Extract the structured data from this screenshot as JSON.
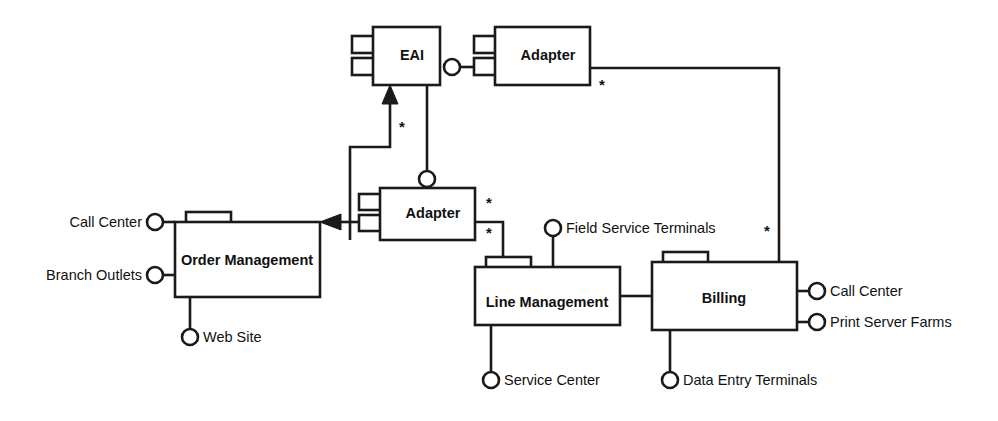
{
  "diagram": {
    "type": "uml-component-diagram",
    "title": "",
    "canvas": {
      "width": 998,
      "height": 421
    },
    "colors": {
      "stroke": "#1a1a1a",
      "fill": "#ffffff",
      "text": "#111111",
      "background": "#ffffff"
    },
    "components": [
      {
        "id": "eai",
        "label": "EAI",
        "x": 373,
        "y": 27,
        "w": 67,
        "h": 58,
        "label_x": 412,
        "label_y": 56,
        "tabs": [
          {
            "x": 352,
            "y": 36,
            "w": 42,
            "h": 17
          },
          {
            "x": 352,
            "y": 58,
            "w": 42,
            "h": 17
          }
        ]
      },
      {
        "id": "adapter-top",
        "label": "Adapter",
        "x": 495,
        "y": 27,
        "w": 95,
        "h": 58,
        "label_x": 548,
        "label_y": 56,
        "tabs": [
          {
            "x": 474,
            "y": 36,
            "w": 42,
            "h": 17
          },
          {
            "x": 474,
            "y": 58,
            "w": 42,
            "h": 17
          }
        ]
      },
      {
        "id": "adapter-lower",
        "label": "Adapter",
        "x": 380,
        "y": 188,
        "w": 95,
        "h": 52,
        "label_x": 433,
        "label_y": 214,
        "tabs": [
          {
            "x": 359,
            "y": 194,
            "w": 42,
            "h": 16
          },
          {
            "x": 359,
            "y": 215,
            "w": 42,
            "h": 16
          }
        ]
      },
      {
        "id": "order-management",
        "label": "Order Management",
        "x": 175,
        "y": 222,
        "w": 145,
        "h": 75,
        "label_x": 247,
        "label_y": 261,
        "tabs": [
          {
            "x": 186,
            "y": 212,
            "w": 45,
            "h": 11
          }
        ]
      },
      {
        "id": "line-management",
        "label": "Line Management",
        "x": 475,
        "y": 267,
        "w": 145,
        "h": 58,
        "label_x": 547,
        "label_y": 303,
        "tabs": [
          {
            "x": 486,
            "y": 257,
            "w": 45,
            "h": 11
          }
        ]
      },
      {
        "id": "billing",
        "label": "Billing",
        "x": 652,
        "y": 262,
        "w": 145,
        "h": 68,
        "label_x": 724,
        "label_y": 299,
        "tabs": [
          {
            "x": 663,
            "y": 252,
            "w": 45,
            "h": 11
          }
        ]
      }
    ],
    "interfaces": [
      {
        "id": "call-center-order",
        "label": "Call Center",
        "owner": "order-management",
        "side": "left",
        "cx": 155,
        "cy": 222,
        "r": 8,
        "stub": {
          "x1": 163,
          "y1": 222,
          "x2": 175,
          "y2": 222
        },
        "label_x": 142,
        "label_y": 223
      },
      {
        "id": "branch-outlets",
        "label": "Branch Outlets",
        "owner": "order-management",
        "side": "left",
        "cx": 155,
        "cy": 275,
        "r": 8,
        "stub": {
          "x1": 163,
          "y1": 275,
          "x2": 175,
          "y2": 275
        },
        "label_x": 142,
        "label_y": 276
      },
      {
        "id": "web-site",
        "label": "Web Site",
        "owner": "order-management",
        "side": "bottom",
        "cx": 190,
        "cy": 337,
        "r": 8,
        "stub": {
          "x1": 190,
          "y1": 297,
          "x2": 190,
          "y2": 329
        },
        "label_x": 203,
        "label_y": 338
      },
      {
        "id": "adapter-lower-top",
        "label": "",
        "owner": "adapter-lower",
        "side": "top",
        "cx": 427,
        "cy": 179,
        "r": 8,
        "stub": {
          "x1": 427,
          "y1": 187,
          "x2": 427,
          "y2": 188
        },
        "label_x": 0,
        "label_y": 0
      },
      {
        "id": "eai-adapter-top-iface",
        "label": "",
        "owner": "adapter-top",
        "side": "left",
        "cx": 452,
        "cy": 67,
        "r": 8,
        "stub": {
          "x1": 460,
          "y1": 67,
          "x2": 474,
          "y2": 67
        },
        "label_x": 0,
        "label_y": 0
      },
      {
        "id": "field-service-terminals",
        "label": "Field Service Terminals",
        "owner": "line-management",
        "side": "top",
        "cx": 553,
        "cy": 228,
        "r": 8,
        "stub": {
          "x1": 553,
          "y1": 236,
          "x2": 553,
          "y2": 267
        },
        "label_x": 566,
        "label_y": 229
      },
      {
        "id": "service-center",
        "label": "Service Center",
        "owner": "line-management",
        "side": "bottom",
        "cx": 491,
        "cy": 380,
        "r": 8,
        "stub": {
          "x1": 491,
          "y1": 325,
          "x2": 491,
          "y2": 372
        },
        "label_x": 504,
        "label_y": 381
      },
      {
        "id": "data-entry-terminals",
        "label": "Data Entry Terminals",
        "owner": "billing",
        "side": "bottom",
        "cx": 670,
        "cy": 380,
        "r": 8,
        "stub": {
          "x1": 670,
          "y1": 330,
          "x2": 670,
          "y2": 372
        },
        "label_x": 683,
        "label_y": 381
      },
      {
        "id": "call-center-billing",
        "label": "Call Center",
        "owner": "billing",
        "side": "right",
        "cx": 817,
        "cy": 291,
        "r": 8,
        "stub": {
          "x1": 797,
          "y1": 291,
          "x2": 809,
          "y2": 291
        },
        "label_x": 830,
        "label_y": 292
      },
      {
        "id": "print-server-farms",
        "label": "Print Server Farms",
        "owner": "billing",
        "side": "right",
        "cx": 817,
        "cy": 322,
        "r": 8,
        "stub": {
          "x1": 797,
          "y1": 322,
          "x2": 809,
          "y2": 322
        },
        "label_x": 830,
        "label_y": 323
      }
    ],
    "connectors": [
      {
        "id": "adapter-lower-to-eai",
        "from": "adapter-lower",
        "to": "eai",
        "path": "M 350 240 L 350 147 L 390 147 L 390 96",
        "arrow": {
          "points": "390,85 382,104 398,104"
        },
        "multiplicity": {
          "label": "*",
          "x": 402,
          "y": 128
        }
      },
      {
        "id": "eai-to-adapter-lower-iface",
        "from": "eai",
        "to": "adapter-lower-top",
        "path": "M 427 85 L 427 171",
        "arrow": null,
        "multiplicity": null
      },
      {
        "id": "adapter-top-to-billing",
        "from": "adapter-top",
        "to": "billing",
        "path": "M 590 68 L 779 68 L 779 262",
        "arrow": null,
        "multiplicity": {
          "label": "*",
          "x": 602,
          "y": 86
        }
      },
      {
        "id": "adapter-top-to-billing-far",
        "from": "adapter-top",
        "to": "billing",
        "path": "",
        "arrow": null,
        "multiplicity": {
          "label": "*",
          "x": 767,
          "y": 232
        }
      },
      {
        "id": "adapter-lower-to-order-management",
        "from": "adapter-lower",
        "to": "order-management",
        "path": "M 359 222 L 340 222",
        "arrow": {
          "points": "320,222 341,214 341,230"
        },
        "multiplicity": null
      },
      {
        "id": "adapter-lower-to-line-management",
        "from": "adapter-lower",
        "to": "line-management",
        "path": "M 475 222 L 503 222 L 503 267",
        "arrow": null,
        "multiplicity": {
          "label": "*",
          "x": 489,
          "y": 204
        }
      },
      {
        "id": "adapter-lower-to-line-management-2",
        "from": "adapter-lower",
        "to": "line-management",
        "path": "",
        "arrow": null,
        "multiplicity": {
          "label": "*",
          "x": 489,
          "y": 234
        }
      },
      {
        "id": "line-management-to-billing",
        "from": "line-management",
        "to": "billing",
        "path": "M 620 296 L 652 296",
        "arrow": null,
        "multiplicity": null
      }
    ]
  }
}
